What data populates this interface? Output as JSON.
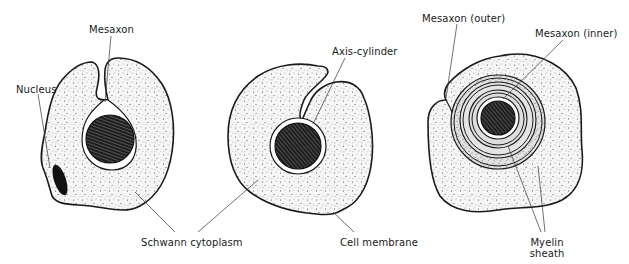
{
  "figure": {
    "panels": [
      {
        "id": "early",
        "description": "Axon partially engulfed by Schwann cell",
        "labels": {
          "mesaxon": "Mesaxon",
          "nucleus": "Nucleus"
        }
      },
      {
        "id": "middle",
        "description": "Axon fully enclosed, mesaxon elongating",
        "labels": {
          "axis_cylinder": "Axis-cylinder"
        }
      },
      {
        "id": "late",
        "description": "Mesaxon spirally wrapped forming myelin",
        "labels": {
          "mesaxon_outer": "Mesaxon (outer)",
          "mesaxon_inner": "Mesaxon (inner)",
          "myelin_line1": "Myelin",
          "myelin_line2": "sheath"
        }
      }
    ],
    "shared_labels": {
      "schwann_cytoplasm": "Schwann cytoplasm",
      "cell_membrane": "Cell membrane"
    },
    "colors": {
      "outline": "#1a1a1a",
      "cytoplasm_fill": "#f4f4f4",
      "myelin_fill": "#dcdcdc",
      "axon_fill": "#1e1e1e",
      "nucleus_fill": "#111111",
      "background": "#ffffff"
    }
  }
}
